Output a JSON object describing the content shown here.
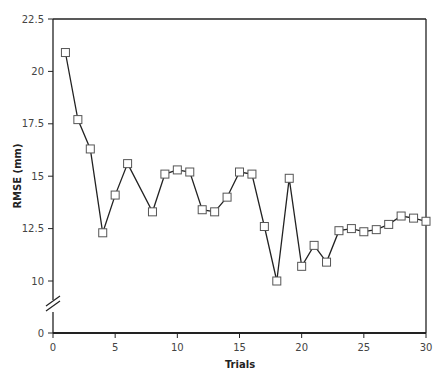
{
  "chart_data": {
    "type": "line",
    "title": "",
    "xlabel": "Trials",
    "ylabel": "RMSE (mm)",
    "xlim": [
      0,
      30
    ],
    "ylim": [
      0,
      22.5
    ],
    "axis_break": {
      "from": 0,
      "to": 10,
      "display": "double-slash on y-axis between 0 and 10"
    },
    "x_ticks": [
      0,
      5,
      10,
      15,
      20,
      25,
      30
    ],
    "x_tick_labels": [
      "0",
      "5",
      "10",
      "15",
      "20",
      "25",
      "30"
    ],
    "y_ticks": [
      0,
      10,
      12.5,
      15,
      17.5,
      20,
      22.5
    ],
    "y_tick_labels": [
      "0",
      "10",
      "12.5",
      "15",
      "17.5",
      "20",
      "22.5"
    ],
    "grid": false,
    "legend": null,
    "marker": "open-square",
    "series": [
      {
        "name": "RMSE",
        "x": [
          1,
          2,
          3,
          4,
          5,
          6,
          8,
          9,
          10,
          11,
          12,
          13,
          14,
          15,
          16,
          17,
          18,
          19,
          20,
          21,
          22,
          23,
          24,
          25,
          26,
          27,
          28,
          29,
          30
        ],
        "values": [
          20.9,
          17.7,
          16.3,
          12.3,
          14.1,
          15.6,
          13.3,
          15.1,
          15.3,
          15.2,
          13.4,
          13.3,
          14.0,
          15.2,
          15.1,
          12.6,
          10.0,
          14.9,
          10.7,
          11.7,
          10.9,
          12.4,
          12.5,
          12.35,
          12.45,
          12.7,
          13.1,
          13.0,
          12.85
        ]
      }
    ]
  },
  "colors": {
    "line": "#222222",
    "marker_fill": "#ffffff",
    "marker_stroke": "#555555",
    "axis": "#222222"
  }
}
